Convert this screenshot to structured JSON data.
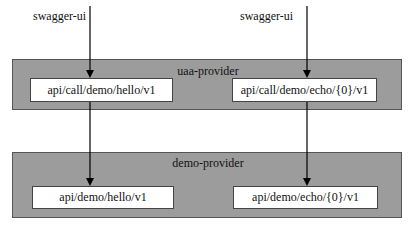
{
  "diagram": {
    "sources": [
      {
        "label": "swagger-ui"
      },
      {
        "label": "swagger-ui"
      }
    ],
    "layers": [
      {
        "title": "uaa-provider",
        "endpoints": [
          "api/call/demo/hello/v1",
          "api/call/demo/echo/{0}/v1"
        ]
      },
      {
        "title": "demo-provider",
        "endpoints": [
          "api/demo/hello/v1",
          "api/demo/echo/{0}/v1"
        ]
      }
    ],
    "edges": [
      {
        "from": "swagger-ui (left)",
        "to": "api/call/demo/hello/v1"
      },
      {
        "from": "swagger-ui (right)",
        "to": "api/call/demo/echo/{0}/v1"
      },
      {
        "from": "api/call/demo/hello/v1",
        "to": "api/demo/hello/v1"
      },
      {
        "from": "api/call/demo/echo/{0}/v1",
        "to": "api/demo/echo/{0}/v1"
      }
    ],
    "colors": {
      "layer_fill": "#9c9c9c",
      "box_fill": "#ffffff",
      "line": "#000000"
    }
  }
}
